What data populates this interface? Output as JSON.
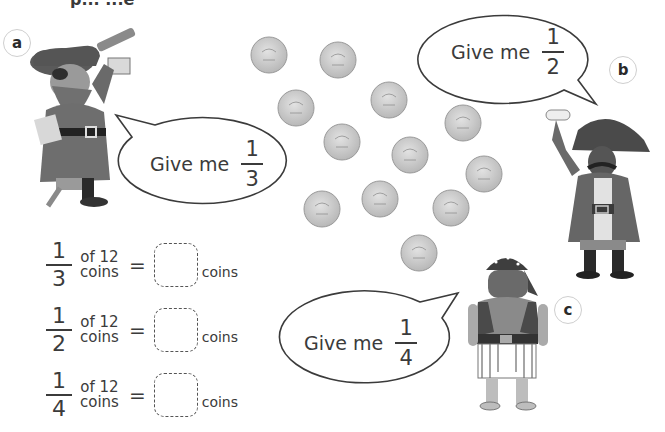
{
  "header": {
    "clipped_title": "p... ...e"
  },
  "labels": {
    "a": "a",
    "b": "b",
    "c": "c"
  },
  "bubbles": [
    {
      "id": "a",
      "prefix": "Give me",
      "numerator": "1",
      "denominator": "3"
    },
    {
      "id": "b",
      "prefix": "Give me",
      "numerator": "1",
      "denominator": "2"
    },
    {
      "id": "c",
      "prefix": "Give me",
      "numerator": "1",
      "denominator": "4"
    }
  ],
  "coins": {
    "count": 12
  },
  "equations": [
    {
      "numerator": "1",
      "denominator": "3",
      "of_text": "of 12",
      "of_unit": "coins",
      "equals": "=",
      "answer": "",
      "unit": "coins"
    },
    {
      "numerator": "1",
      "denominator": "2",
      "of_text": "of 12",
      "of_unit": "coins",
      "equals": "=",
      "answer": "",
      "unit": "coins"
    },
    {
      "numerator": "1",
      "denominator": "4",
      "of_text": "of 12",
      "of_unit": "coins",
      "equals": "=",
      "answer": "",
      "unit": "coins"
    }
  ],
  "colors": {
    "ink": "#3b3b3b",
    "coin_fill": "#cfcfcf",
    "coin_edge": "#9a9a9a",
    "label_ring": "#cfcfcf"
  }
}
